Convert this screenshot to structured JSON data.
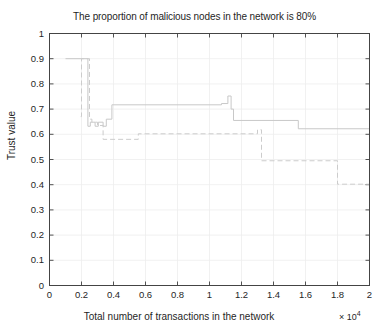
{
  "chart_data": {
    "type": "line",
    "title": "The proportion of malicious nodes in the network is 80%",
    "xlabel": "Total number of transactions in the network",
    "ylabel": "Trust value",
    "x_exponent_prefix": "× 10",
    "x_exponent_power": "4",
    "xlim": [
      0,
      2
    ],
    "ylim": [
      0,
      1
    ],
    "grid": true,
    "legend_position": "none",
    "xticks": [
      "0",
      "0.2",
      "0.4",
      "0.6",
      "0.8",
      "1",
      "1.2",
      "1.4",
      "1.6",
      "1.8",
      "2"
    ],
    "xtick_values": [
      0,
      0.2,
      0.4,
      0.6,
      0.8,
      1.0,
      1.2,
      1.4,
      1.6,
      1.8,
      2.0
    ],
    "yticks": [
      "0",
      "0.1",
      "0.2",
      "0.3",
      "0.4",
      "0.5",
      "0.6",
      "0.7",
      "0.8",
      "0.9",
      "1"
    ],
    "ytick_values": [
      0,
      0.1,
      0.2,
      0.3,
      0.4,
      0.5,
      0.6,
      0.7,
      0.8,
      0.9,
      1.0
    ],
    "axis_color": "#404040",
    "grid_color": "#eeeeee",
    "series": [
      {
        "name": "solid-series",
        "style": "solid",
        "color": "#c8c8c8",
        "x": [
          0.1,
          0.24,
          0.24,
          0.255,
          0.255,
          0.285,
          0.285,
          0.305,
          0.305,
          0.335,
          0.335,
          0.355,
          0.355,
          0.39,
          0.39,
          1.075,
          1.075,
          1.115,
          1.115,
          1.135,
          1.135,
          1.15,
          1.15,
          1.555,
          1.555,
          2.0
        ],
        "y": [
          0.9,
          0.9,
          0.632,
          0.632,
          0.648,
          0.648,
          0.632,
          0.632,
          0.648,
          0.648,
          0.632,
          0.632,
          0.66,
          0.66,
          0.717,
          0.717,
          0.722,
          0.722,
          0.752,
          0.752,
          0.7,
          0.7,
          0.655,
          0.655,
          0.622,
          0.622
        ]
      },
      {
        "name": "dashed-series",
        "style": "dashed",
        "color": "#cccccc",
        "x": [
          0.195,
          0.2,
          0.2,
          0.25,
          0.25,
          0.265,
          0.265,
          0.3,
          0.3,
          0.335,
          0.335,
          0.555,
          0.555,
          1.3,
          1.3,
          1.325,
          1.325,
          1.8,
          1.8,
          2.0
        ],
        "y": [
          0.67,
          0.67,
          0.9,
          0.9,
          0.66,
          0.66,
          0.648,
          0.648,
          0.635,
          0.635,
          0.58,
          0.58,
          0.602,
          0.602,
          0.618,
          0.618,
          0.495,
          0.495,
          0.402,
          0.402
        ]
      }
    ]
  }
}
